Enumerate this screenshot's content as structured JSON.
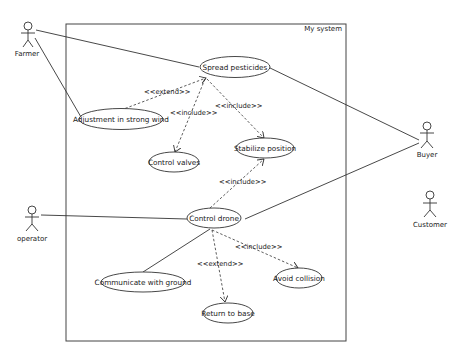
{
  "diagram": {
    "type": "UML use case diagram",
    "system": {
      "label": "My system"
    },
    "actors": [
      {
        "id": "farmer",
        "label": "Farmer"
      },
      {
        "id": "operator",
        "label": "operator"
      },
      {
        "id": "buyer",
        "label": "Buyer"
      },
      {
        "id": "customer",
        "label": "Customer"
      }
    ],
    "use_cases": [
      {
        "id": "spread",
        "label": "Spread pesticides"
      },
      {
        "id": "adjust",
        "label": "Adjustment in strong wind"
      },
      {
        "id": "valves",
        "label": "Control valves"
      },
      {
        "id": "stabilize",
        "label": "Stabilize position"
      },
      {
        "id": "drone",
        "label": "Control drone"
      },
      {
        "id": "communicate",
        "label": "Communicate with ground"
      },
      {
        "id": "avoid",
        "label": "Avoid collision"
      },
      {
        "id": "return",
        "label": "Return to base"
      }
    ],
    "relations": [
      {
        "from": "adjust",
        "to": "spread",
        "stereotype": "<<extend>>"
      },
      {
        "from": "spread",
        "to": "valves",
        "stereotype": "<<include>>"
      },
      {
        "from": "spread",
        "to": "stabilize",
        "stereotype": "<<include>>"
      },
      {
        "from": "drone",
        "to": "stabilize",
        "stereotype": "<<include>>"
      },
      {
        "from": "drone",
        "to": "avoid",
        "stereotype": "<<include>>"
      },
      {
        "from": "return",
        "to": "drone",
        "stereotype": "<<extend>>"
      }
    ],
    "associations": [
      [
        "farmer",
        "spread"
      ],
      [
        "farmer",
        "adjust"
      ],
      [
        "buyer",
        "spread"
      ],
      [
        "buyer",
        "drone"
      ],
      [
        "operator",
        "drone"
      ],
      [
        "communicate",
        "drone"
      ]
    ]
  }
}
